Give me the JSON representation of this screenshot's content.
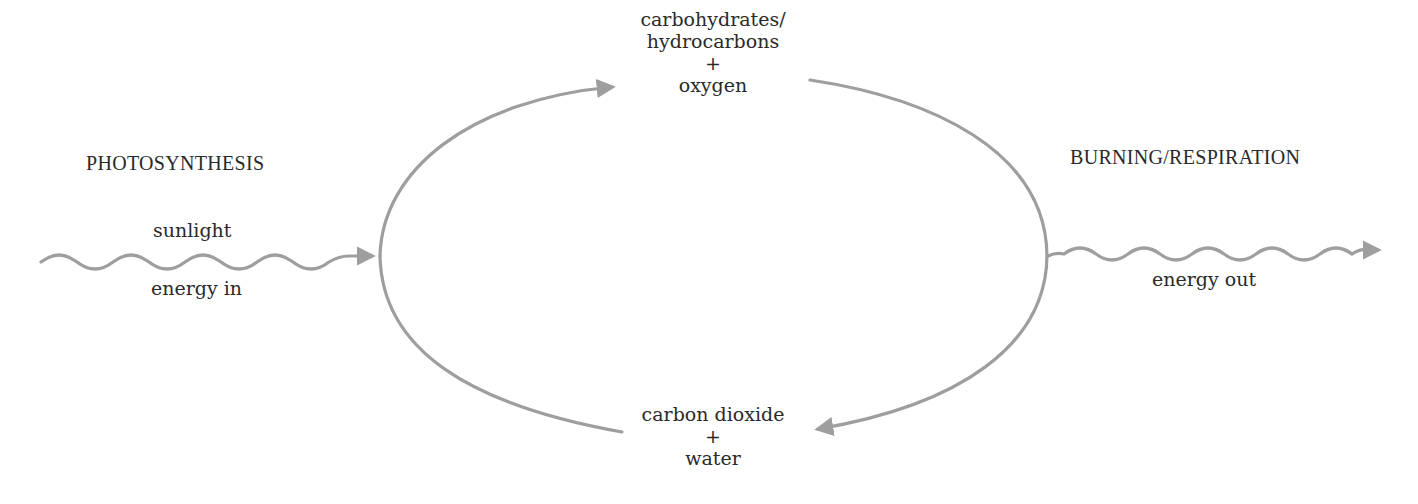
{
  "diagram": {
    "type": "cycle",
    "colors": {
      "stroke": "#9e9e9e",
      "text": "#2a2a2a",
      "background": "#ffffff"
    },
    "nodes": {
      "top": {
        "lines": [
          "carbohydrates/",
          "hydrocarbons",
          "+",
          "oxygen"
        ]
      },
      "bottom": {
        "lines": [
          "carbon dioxide",
          "+",
          "water"
        ]
      }
    },
    "processes": {
      "left": {
        "label": "PHOTOSYNTHESIS",
        "energy_above": "sunlight",
        "energy_below": "energy in"
      },
      "right": {
        "label": "BURNING/RESPIRATION",
        "energy_below": "energy out"
      }
    },
    "edges": [
      {
        "from": "carbon dioxide + water",
        "to": "carbohydrates/hydrocarbons + oxygen",
        "via": "PHOTOSYNTHESIS",
        "icon": "arrow-icon"
      },
      {
        "from": "carbohydrates/hydrocarbons + oxygen",
        "to": "carbon dioxide + water",
        "via": "BURNING/RESPIRATION",
        "icon": "arrow-icon"
      },
      {
        "from": "sunlight",
        "to": "PHOTOSYNTHESIS",
        "label": "energy in",
        "icon": "wavy-arrow-icon"
      },
      {
        "from": "BURNING/RESPIRATION",
        "to": "environment",
        "label": "energy out",
        "icon": "wavy-arrow-icon"
      }
    ]
  }
}
